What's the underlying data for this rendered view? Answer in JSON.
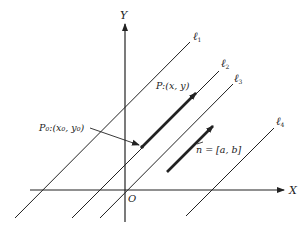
{
  "diagram": {
    "axes": {
      "x_label": "X",
      "y_label": "Y",
      "origin_label": "O"
    },
    "lines": [
      {
        "id": "l1",
        "label": "ℓ",
        "subscript": "1"
      },
      {
        "id": "l2",
        "label": "ℓ",
        "subscript": "2"
      },
      {
        "id": "l3",
        "label": "ℓ",
        "subscript": "3"
      },
      {
        "id": "l4",
        "label": "ℓ",
        "subscript": "4"
      }
    ],
    "points": {
      "p": {
        "label": "P:(x, y)"
      },
      "p0": {
        "label": "P₀:(x₀, y₀)"
      }
    },
    "vector": {
      "label": "n = [a, b]"
    },
    "colors": {
      "stroke": "#222222",
      "background": "#ffffff"
    }
  }
}
